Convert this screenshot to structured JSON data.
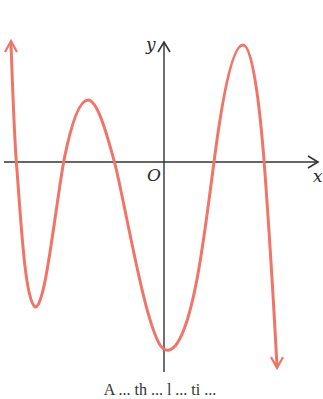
{
  "figure": {
    "axes": {
      "x_label": "x",
      "y_label": "y",
      "origin_label": "O",
      "axis_color": "#333333"
    },
    "curve": {
      "color": "#f07468",
      "description": "polynomial graph with leading down-left arrow up and right end arrow down",
      "features": [
        {
          "type": "end-arrow",
          "direction": "up",
          "side": "left"
        },
        {
          "type": "x-intercept",
          "order": 1
        },
        {
          "type": "local-min",
          "order": 1
        },
        {
          "type": "x-intercept",
          "order": 2
        },
        {
          "type": "local-max",
          "order": 1
        },
        {
          "type": "x-intercept",
          "order": 3
        },
        {
          "type": "local-min",
          "order": 2,
          "note": "near y-axis, lowest point"
        },
        {
          "type": "x-intercept",
          "order": 4
        },
        {
          "type": "local-max",
          "order": 2,
          "note": "highest point"
        },
        {
          "type": "x-intercept",
          "order": 5
        },
        {
          "type": "end-arrow",
          "direction": "down",
          "side": "right"
        }
      ]
    },
    "caption": "A ... th ... l ... ti ..."
  }
}
